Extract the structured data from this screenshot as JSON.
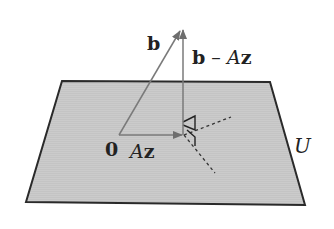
{
  "diagram": {
    "type": "vector-projection-onto-subspace",
    "plane": {
      "label": "U",
      "fill": "#c9c9c9",
      "stroke": "#2a2a2a"
    },
    "origin": {
      "label": "0"
    },
    "vectors": [
      {
        "id": "b",
        "label_bold": "b",
        "label_rest": "",
        "color": "#7a7a7a"
      },
      {
        "id": "Az",
        "label_italic": "A",
        "label_bold": "z",
        "color": "#7a7a7a"
      },
      {
        "id": "b-Az",
        "label_bold": "b",
        "label_minus": " – ",
        "label_italic": "A",
        "label_bold2": "z",
        "color": "#7a7a7a"
      }
    ],
    "annotations": {
      "right_angle_marker": true,
      "dashed_lines": 2
    }
  }
}
